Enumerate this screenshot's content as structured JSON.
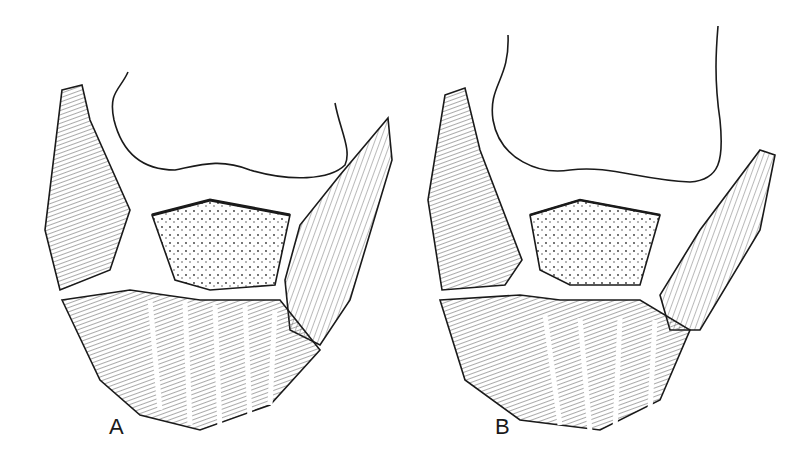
{
  "figure": {
    "panels": [
      {
        "id": "A",
        "label": "A"
      },
      {
        "id": "B",
        "label": "B"
      }
    ],
    "colors": {
      "ink": "#1a1a1a",
      "hatch": "#555555",
      "background": "#ffffff"
    }
  }
}
